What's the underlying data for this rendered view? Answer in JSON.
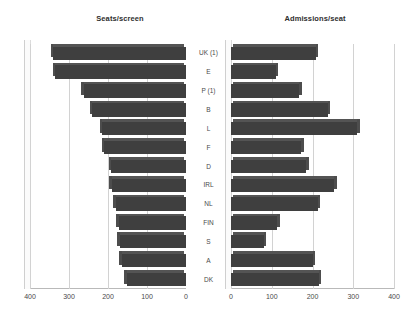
{
  "chart_data": [
    {
      "type": "bar",
      "orientation": "horizontal",
      "title": "Seats/screen",
      "xlabel": "",
      "ylabel": "",
      "categories": [
        "UK (1)",
        "E",
        "P (1)",
        "B",
        "L",
        "F",
        "D",
        "IRL",
        "NL",
        "FIN",
        "S",
        "A",
        "DK"
      ],
      "values": [
        340,
        335,
        262,
        240,
        215,
        210,
        192,
        190,
        180,
        172,
        170,
        165,
        152
      ],
      "xlim": [
        400,
        0
      ],
      "xticks": [
        400,
        300,
        200,
        100,
        0
      ],
      "xtick_labels": [
        "400",
        "300",
        "200",
        "100",
        "0"
      ],
      "axis_reversed": true,
      "grid": true,
      "legend": "none",
      "bar_color": "#3f3f3f"
    },
    {
      "type": "bar",
      "orientation": "horizontal",
      "title": "Admissions/seat",
      "xlabel": "",
      "ylabel": "",
      "categories": [
        "UK (1)",
        "E",
        "P (1)",
        "B",
        "L",
        "F",
        "D",
        "IRL",
        "NL",
        "FIN",
        "S",
        "A",
        "DK"
      ],
      "values": [
        208,
        110,
        168,
        237,
        310,
        172,
        185,
        253,
        213,
        113,
        80,
        200,
        215
      ],
      "xlim": [
        0,
        400
      ],
      "xticks": [
        0,
        100,
        200,
        300,
        400
      ],
      "xtick_labels": [
        "0",
        "100",
        "200",
        "300",
        "400"
      ],
      "axis_reversed": false,
      "grid": true,
      "legend": "none",
      "bar_color": "#3f3f3f"
    }
  ],
  "panels": {
    "left": {
      "title": "Seats/screen",
      "ticks": [
        "400",
        "300",
        "200",
        "100",
        "0"
      ]
    },
    "right": {
      "title": "Admissions/seat",
      "ticks": [
        "0",
        "100",
        "200",
        "300",
        "400"
      ]
    }
  },
  "categories": [
    "UK (1)",
    "E",
    "P (1)",
    "B",
    "L",
    "F",
    "D",
    "IRL",
    "NL",
    "FIN",
    "S",
    "A",
    "DK"
  ],
  "colors": {
    "bar": "#3f3f3f",
    "grid": "#d2d2d2",
    "axis": "#b9b9b9",
    "text": "#4a4a4a",
    "background": "#ffffff"
  }
}
